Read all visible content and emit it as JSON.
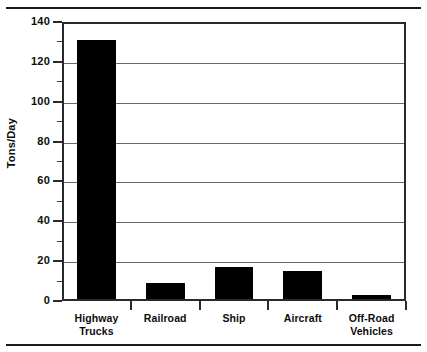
{
  "chart_data": {
    "type": "bar",
    "title": "",
    "xlabel": "",
    "ylabel": "Tons/Day",
    "categories": [
      "Highway Trucks",
      "Railroad",
      "Ship",
      "Aircraft",
      "Off-Road Vehicles"
    ],
    "category_lines": [
      [
        "Highway",
        "Trucks"
      ],
      [
        "Railroad"
      ],
      [
        "Ship"
      ],
      [
        "Aircraft"
      ],
      [
        "Off-Road",
        "Vehicles"
      ]
    ],
    "values": [
      130,
      8,
      16,
      14,
      2
    ],
    "ylim": [
      0,
      140
    ],
    "ytick_major": [
      0,
      20,
      40,
      60,
      80,
      100,
      120,
      140
    ],
    "ytick_minor": [
      10,
      30,
      50,
      70,
      90,
      110,
      130
    ],
    "ytick_labels": [
      "0",
      "20",
      "40",
      "60",
      "80",
      "100",
      "120",
      "140"
    ],
    "grid": true,
    "gridlines_at": [
      20,
      40,
      60,
      80,
      100,
      120
    ],
    "legend": null,
    "bar_color": "#000000",
    "axis_color": "#2a2a2a",
    "grid_color": "#6a6a6a",
    "background": "#ffffff"
  }
}
